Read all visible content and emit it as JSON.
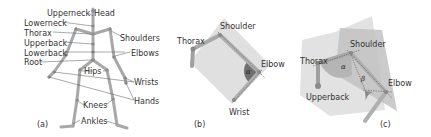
{
  "panels": [
    {
      "id": "a",
      "caption": "(a)",
      "labels": {
        "upperneck": "Upperneck",
        "head": "Head",
        "lowerneck": "Lowerneck",
        "thorax": "Thorax",
        "upperback": "Upperback",
        "lowerback": "Lowerback",
        "root": "Root",
        "shoulders": "Shoulders",
        "elbows": "Elbows",
        "hips": "Hips",
        "wrists": "Wrists",
        "hands": "Hands",
        "knees": "Knees",
        "ankles": "Ankles"
      }
    },
    {
      "id": "b",
      "caption": "(b)",
      "labels": {
        "shoulder": "Shoulder",
        "thorax": "Thorax",
        "elbow": "Elbow",
        "wrist": "Wrist",
        "angle": "α"
      }
    },
    {
      "id": "c",
      "caption": "(c)",
      "labels": {
        "shoulder": "Shoulder",
        "thorax": "Thorax",
        "upperback": "Upperback",
        "elbow": "Elbow",
        "angle_alpha": "α",
        "angle_beta": "β"
      }
    }
  ],
  "colors": {
    "bone": "#b0b0b0",
    "bone_edge": "#8a8a8a",
    "joint": "#9a9a9a",
    "plane_light": "#dcdcdc",
    "plane_dark": "#c4c4c4",
    "angle_fill": "#6e6e6e",
    "leader": "#555555"
  }
}
